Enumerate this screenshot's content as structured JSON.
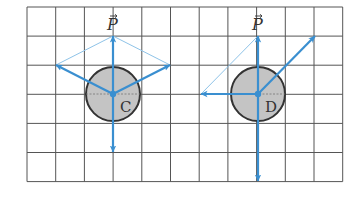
{
  "diagram": {
    "grid": {
      "x0": 27,
      "y0": 7,
      "cols": 11,
      "rows": 6,
      "cell_w": 28.7,
      "cell_h": 29.1,
      "line_color": "#555555"
    },
    "colors": {
      "arrow": "#3a8fd0",
      "thin_line": "#8ec3e8",
      "disk_fill": "#c4c4c4",
      "disk_stroke": "#333333"
    },
    "panels": [
      {
        "id": "C",
        "label": "C",
        "force_label": "P",
        "center": [
          113,
          94
        ],
        "radius": 27,
        "arrows": [
          {
            "name": "P",
            "to": [
              113,
              36
            ]
          },
          {
            "name": "upper-left",
            "to": [
              56,
              65
            ]
          },
          {
            "name": "upper-right",
            "to": [
              170,
              65
            ]
          },
          {
            "name": "down",
            "to": [
              113,
              152
            ]
          }
        ],
        "construction_lines": [
          {
            "from": [
              56,
              65
            ],
            "to": [
              113,
              36
            ]
          },
          {
            "from": [
              170,
              65
            ],
            "to": [
              113,
              36
            ]
          }
        ]
      },
      {
        "id": "D",
        "label": "D",
        "force_label": "P",
        "center": [
          258,
          94
        ],
        "radius": 27,
        "arrows": [
          {
            "name": "P",
            "to": [
              258,
              36
            ]
          },
          {
            "name": "left",
            "to": [
              201,
              94
            ]
          },
          {
            "name": "diagonal",
            "to": [
              315,
              36
            ]
          },
          {
            "name": "down",
            "to": [
              258,
              181
            ]
          }
        ],
        "construction_lines": [
          {
            "from": [
              201,
              94
            ],
            "to": [
              258,
              36
            ]
          }
        ]
      }
    ]
  }
}
